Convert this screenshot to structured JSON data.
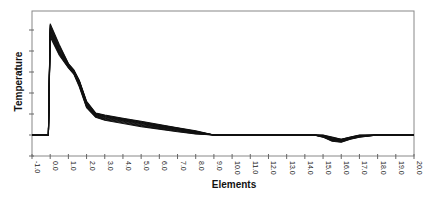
{
  "chart_data": {
    "type": "line",
    "title": "",
    "xlabel": "Elements",
    "ylabel": "Temperature",
    "xlim": [
      -1.0,
      20.0
    ],
    "ylim": [
      -1,
      6
    ],
    "x_ticks": [
      "-1.0",
      "0.0",
      "1.0",
      "2.0",
      "3.0",
      "4.0",
      "5.0",
      "6.0",
      "7.0",
      "8.0",
      "9.0",
      "10.0",
      "11.0",
      "12.0",
      "13.0",
      "14.0",
      "15.0",
      "16.0",
      "17.0",
      "18.0",
      "19.0",
      "20.0"
    ],
    "y_ticks_labeled": false,
    "grid": false,
    "legend": null,
    "series_description": "Bundle of ~10 overlapping temperature traces",
    "series": [
      {
        "name": "upper envelope",
        "x": [
          -1.0,
          -0.1,
          0.0,
          0.1,
          0.5,
          1.0,
          1.3,
          1.6,
          2.0,
          2.5,
          3.0,
          4.0,
          5.0,
          6.0,
          7.0,
          8.0,
          9.0,
          14.5,
          15.0,
          15.5,
          16.0,
          16.5,
          17.0,
          18.0,
          20.0
        ],
        "y": [
          0,
          0,
          5.3,
          5.1,
          4.3,
          3.4,
          3.1,
          2.6,
          1.6,
          1.05,
          0.95,
          0.8,
          0.65,
          0.5,
          0.35,
          0.2,
          0.0,
          0.0,
          0.0,
          -0.1,
          -0.2,
          -0.1,
          0.0,
          0.0,
          0.0
        ]
      },
      {
        "name": "middle",
        "x": [
          -1.0,
          -0.1,
          0.0,
          0.1,
          0.5,
          1.0,
          1.3,
          1.6,
          2.0,
          2.5,
          3.0,
          4.0,
          5.0,
          6.0,
          7.0,
          8.0,
          9.0,
          14.5,
          15.0,
          15.5,
          16.0,
          16.5,
          17.0,
          18.0,
          20.0
        ],
        "y": [
          0,
          0,
          5.0,
          4.8,
          4.0,
          3.3,
          3.0,
          2.5,
          1.45,
          0.95,
          0.85,
          0.7,
          0.55,
          0.4,
          0.27,
          0.12,
          0.0,
          0.0,
          -0.05,
          -0.2,
          -0.25,
          -0.15,
          -0.05,
          0.0,
          0.0
        ]
      },
      {
        "name": "lower envelope",
        "x": [
          -1.0,
          -0.1,
          0.0,
          0.1,
          0.5,
          1.0,
          1.3,
          1.6,
          2.0,
          2.5,
          3.0,
          4.0,
          5.0,
          6.0,
          7.0,
          8.0,
          9.0,
          14.5,
          15.0,
          15.5,
          16.0,
          16.5,
          17.0,
          18.0,
          20.0
        ],
        "y": [
          0,
          0,
          4.7,
          4.5,
          3.8,
          3.2,
          2.9,
          2.3,
          1.3,
          0.85,
          0.7,
          0.55,
          0.4,
          0.28,
          0.15,
          0.05,
          0.0,
          0.0,
          -0.1,
          -0.3,
          -0.35,
          -0.2,
          -0.1,
          0.0,
          0.0
        ]
      }
    ]
  }
}
